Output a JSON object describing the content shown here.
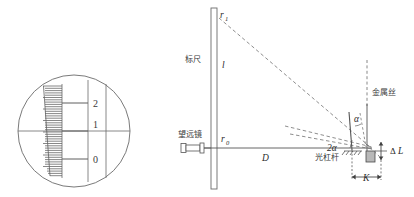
{
  "figure": {
    "line_color": "#555555",
    "dash_color": "#777777",
    "text_color": "#2b2b2b"
  },
  "telescope_view": {
    "name": "telescope-eyepiece-view",
    "scale_numbers": [
      "2",
      "1",
      "0"
    ],
    "major_ticks": 3,
    "minor_tick_count": 40
  },
  "labels": {
    "scale_ruler_cn": "标尺",
    "telescope_cn": "望远镜",
    "optical_lever_cn": "光杠杆",
    "metal_wire_cn": "金属丝",
    "reading_top": "r",
    "reading_top_sub": "1",
    "reading_bottom": "r",
    "reading_bottom_sub": "0",
    "segment_l": "l",
    "distance_D": "D",
    "angle_two_alpha": "2α",
    "angle_alpha": "α",
    "delta_L": "Δ",
    "delta_L_italic": "L",
    "lever_arm_K": "K"
  }
}
